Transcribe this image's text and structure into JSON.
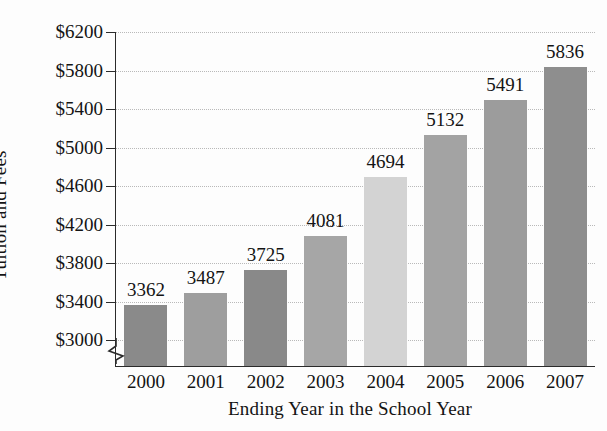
{
  "chart_data": {
    "type": "bar",
    "title": "",
    "xlabel": "Ending Year in the School Year",
    "ylabel": "Tuition and Fees",
    "categories": [
      "2000",
      "2001",
      "2002",
      "2003",
      "2004",
      "2005",
      "2006",
      "2007"
    ],
    "values": [
      3362,
      3487,
      3725,
      4081,
      4694,
      5132,
      5491,
      5836
    ],
    "value_labels": [
      "3362",
      "3487",
      "3725",
      "4081",
      "4694",
      "5132",
      "5491",
      "5836"
    ],
    "ylim": [
      2860,
      6200
    ],
    "ytick_values": [
      3000,
      3400,
      3800,
      4200,
      4600,
      5000,
      5400,
      5800,
      6200
    ],
    "ytick_labels": [
      "$3000",
      "$3400",
      "$3800",
      "$4200",
      "$4600",
      "$5000",
      "$5400",
      "$5800",
      "$6200"
    ],
    "ytick_step": 400,
    "grid": true,
    "grid_style": "dotted",
    "legend": false,
    "axis_break": true,
    "axis_break_axis": "y",
    "bar_colors": [
      "#8a8a8a",
      "#9e9e9e",
      "#898989",
      "#a6a6a6",
      "#d3d3d3",
      "#a3a3a3",
      "#9c9c9c",
      "#8e8e8e"
    ]
  },
  "axis": {
    "y_title": "Tuition and Fees",
    "x_title": "Ending Year in the School Year"
  }
}
